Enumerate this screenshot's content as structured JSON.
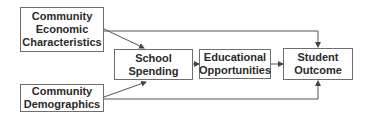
{
  "diagram": {
    "nodes": [
      {
        "id": "econ",
        "lines": [
          "Community",
          "Economic",
          "Characteristics"
        ]
      },
      {
        "id": "spending",
        "lines": [
          "School",
          "Spending"
        ]
      },
      {
        "id": "opportunities",
        "lines": [
          "Educational",
          "Opportunities"
        ]
      },
      {
        "id": "outcome",
        "lines": [
          "Student",
          "Outcome"
        ]
      },
      {
        "id": "demographics",
        "lines": [
          "Community",
          "Demographics"
        ]
      }
    ],
    "edges": [
      {
        "from": "econ",
        "to": "spending"
      },
      {
        "from": "econ",
        "to": "outcome"
      },
      {
        "from": "demographics",
        "to": "spending"
      },
      {
        "from": "demographics",
        "to": "outcome"
      },
      {
        "from": "spending",
        "to": "opportunities"
      },
      {
        "from": "opportunities",
        "to": "outcome"
      }
    ],
    "colors": {
      "line": "#555555",
      "border": "#6e6e6e",
      "text": "#2a2a2a"
    }
  }
}
